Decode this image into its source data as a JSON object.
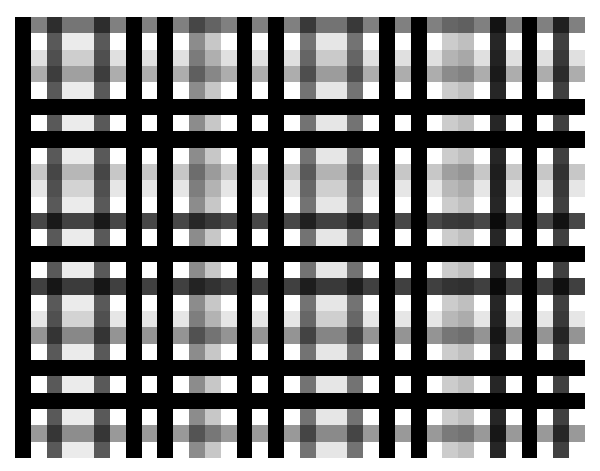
{
  "pattern": {
    "name": "grayscale plaid grid",
    "origin": {
      "x": 15,
      "y": 17
    },
    "size": {
      "width": 570,
      "height": 441
    },
    "columns": 36,
    "rows": 27,
    "background": "#ffffff",
    "column_tones": [
      1,
      0,
      0.65,
      0.08,
      0.08,
      0.65,
      0,
      1,
      0,
      1,
      0,
      0.45,
      0.22,
      0,
      1,
      0,
      1,
      0,
      0.55,
      0.1,
      0.1,
      0.55,
      0,
      1,
      0,
      1,
      0,
      0.2,
      0.25,
      0,
      0.85,
      0,
      1,
      0,
      0.75,
      0
    ],
    "row_tones": [
      0.5,
      0,
      0.12,
      0.32,
      0,
      1,
      0,
      1,
      0,
      0.22,
      0.1,
      0,
      0.72,
      0,
      1,
      0,
      0.75,
      0,
      0.1,
      0.42,
      0,
      1,
      0,
      1,
      0,
      0.4,
      0
    ]
  }
}
